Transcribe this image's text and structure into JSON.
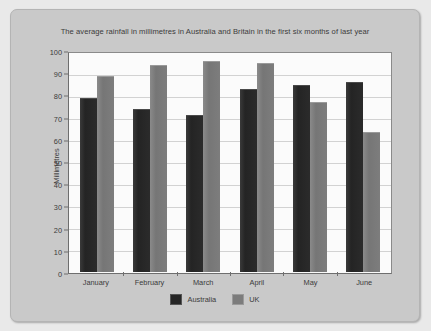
{
  "chart_data": {
    "type": "bar",
    "title": "The average rainfall in millimetres in Australia and Britain in the first six months of last year",
    "xlabel": "",
    "ylabel": "Millimetres",
    "categories": [
      "January",
      "February",
      "March",
      "April",
      "May",
      "June"
    ],
    "series": [
      {
        "name": "Australia",
        "color": "#262626",
        "values": [
          80,
          75,
          72,
          84,
          86,
          87
        ]
      },
      {
        "name": "UK",
        "color": "#7c7c7c",
        "values": [
          90,
          95,
          97,
          96,
          78,
          64
        ]
      }
    ],
    "ylim": [
      0,
      100
    ],
    "ytick_step": 10,
    "yticks": [
      "100",
      "90",
      "80",
      "70",
      "60",
      "50",
      "40",
      "30",
      "20",
      "10",
      "0"
    ],
    "grid": true,
    "legend_position": "bottom"
  },
  "legend": {
    "items": [
      {
        "label": "Australia",
        "swatch": "australia-swatch"
      },
      {
        "label": "UK",
        "swatch": "uk-swatch"
      }
    ]
  },
  "colors": {
    "panel_background": "#c9c9c9",
    "plot_background": "#fbfbfb",
    "gridline": "#d2d2d2",
    "axis": "#6e6e6e",
    "text": "#3b3b3b",
    "australia_bar": "#262626",
    "uk_bar": "#7c7c7c"
  }
}
